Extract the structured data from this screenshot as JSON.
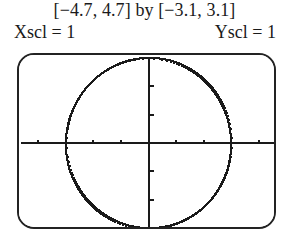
{
  "header": {
    "window_range": "[−4.7, 4.7] by [−3.1, 3.1]",
    "xscl_label": "Xscl = 1",
    "yscl_label": "Yscl = 1"
  },
  "chart_data": {
    "type": "scatter",
    "title": "",
    "subtitle": "",
    "xlabel": "",
    "ylabel": "",
    "xlim": [
      -4.7,
      4.7
    ],
    "ylim": [
      -3.1,
      3.1
    ],
    "xscl": 1,
    "yscl": 1,
    "grid": false,
    "legend": null,
    "axes_color": "#1a1a1a",
    "curve_color": "#1a1a1a",
    "background": "#ffffff",
    "annotations": [],
    "series": [
      {
        "name": "circle",
        "equation": "x^2 + y^2 = 9",
        "shape": "circle",
        "center": [
          0,
          0
        ],
        "radius": 3,
        "style": "pixelated-dotted",
        "values": []
      }
    ],
    "x_ticks": [
      -4,
      -3,
      -2,
      -1,
      1,
      2,
      3,
      4
    ],
    "y_ticks": [
      -3,
      -2,
      -1,
      1,
      2,
      3
    ]
  }
}
